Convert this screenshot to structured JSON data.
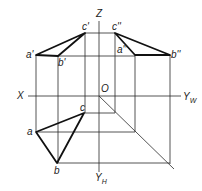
{
  "figure": {
    "line_color": "#222222",
    "background": "#ffffff"
  },
  "axes": {
    "z_label": "Z",
    "x_label": "X",
    "origin_label": "O",
    "yw_label": "Y",
    "yw_sub": "W",
    "yh_label": "Y",
    "yh_sub": "H"
  },
  "points": {
    "front": {
      "a": "a'",
      "b": "b'",
      "c": "c'"
    },
    "side": {
      "a": "a''",
      "b": "b''",
      "c": "c''"
    },
    "top": {
      "a": "a",
      "b": "b",
      "c": "c"
    }
  }
}
